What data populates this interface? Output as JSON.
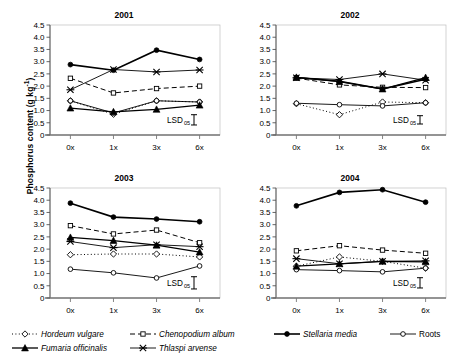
{
  "figure": {
    "ylabel_text": "Phosphorus content (g kg",
    "ylabel_sup": "-1",
    "ylabel_tail": ")",
    "lsd_label": "LSD",
    "lsd_sub": "05"
  },
  "legend": {
    "position": "bottom",
    "items": [
      {
        "name": "Hordeum vulgare",
        "marker": "open-diamond",
        "line": "dotted",
        "italic": true,
        "key": "hordeum_vulgare"
      },
      {
        "name": "Chenopodium album",
        "marker": "open-square",
        "line": "dashed",
        "italic": true,
        "key": "chenopodium_album"
      },
      {
        "name": "Stellaria media",
        "marker": "filled-circle",
        "line": "solid",
        "italic": true,
        "key": "stellaria_media"
      },
      {
        "name": "Roots",
        "marker": "open-circle",
        "line": "solid",
        "italic": false,
        "key": "roots"
      },
      {
        "name": "Fumaria officinalis",
        "marker": "filled-triangle",
        "line": "solid",
        "italic": true,
        "key": "fumaria_officinalis"
      },
      {
        "name": "Thlaspi arvense",
        "marker": "cross-x",
        "line": "solid",
        "italic": true,
        "key": "thlaspi_arvense"
      }
    ]
  },
  "chart_data": {
    "type": "line",
    "xlabel": "",
    "ylabel": "Phosphorus content (g kg-1)",
    "categories": [
      "0x",
      "1x",
      "3x",
      "6x"
    ],
    "yticks": [
      "0",
      "0.5",
      "1.0",
      "1.5",
      "2.0",
      "2.5",
      "3.0",
      "3.5",
      "4.0",
      "4.5"
    ],
    "ylim": [
      0,
      4.5
    ],
    "grid": false,
    "panels": [
      {
        "title": "2001",
        "lsd_bar": 0.42,
        "series": [
          {
            "name": "Hordeum vulgare",
            "key": "hordeum_vulgare",
            "values": [
              1.4,
              0.85,
              1.4,
              1.35
            ]
          },
          {
            "name": "Chenopodium album",
            "key": "chenopodium_album",
            "values": [
              2.32,
              1.72,
              1.9,
              2.0
            ]
          },
          {
            "name": "Stellaria media",
            "key": "stellaria_media",
            "values": [
              2.88,
              2.65,
              3.47,
              3.09
            ]
          },
          {
            "name": "Roots",
            "key": "roots",
            "values": [
              1.4,
              0.9,
              1.4,
              1.35
            ]
          },
          {
            "name": "Fumaria officinalis",
            "key": "fumaria_officinalis",
            "values": [
              1.1,
              0.95,
              1.05,
              1.22
            ]
          },
          {
            "name": "Thlaspi arvense",
            "key": "thlaspi_arvense",
            "values": [
              1.85,
              2.68,
              2.58,
              2.66
            ]
          }
        ]
      },
      {
        "title": "2002",
        "lsd_bar": 0.34,
        "series": [
          {
            "name": "Hordeum vulgare",
            "key": "hordeum_vulgare",
            "values": [
              1.28,
              0.83,
              1.35,
              1.32
            ]
          },
          {
            "name": "Chenopodium album",
            "key": "chenopodium_album",
            "values": [
              2.33,
              2.05,
              1.95,
              1.94
            ]
          },
          {
            "name": "Stellaria media",
            "key": "stellaria_media",
            "values": [
              2.35,
              2.2,
              1.88,
              2.28
            ]
          },
          {
            "name": "Roots",
            "key": "roots",
            "values": [
              1.3,
              1.24,
              1.19,
              1.32
            ]
          },
          {
            "name": "Fumaria officinalis",
            "key": "fumaria_officinalis",
            "values": [
              2.36,
              2.18,
              1.88,
              2.35
            ]
          },
          {
            "name": "Thlaspi arvense",
            "key": "thlaspi_arvense",
            "values": [
              2.34,
              2.27,
              2.5,
              2.24
            ]
          }
        ]
      },
      {
        "title": "2003",
        "lsd_bar": 0.5,
        "series": [
          {
            "name": "Hordeum vulgare",
            "key": "hordeum_vulgare",
            "values": [
              1.77,
              1.8,
              1.8,
              1.68
            ]
          },
          {
            "name": "Chenopodium album",
            "key": "chenopodium_album",
            "values": [
              2.96,
              2.62,
              2.78,
              2.26
            ]
          },
          {
            "name": "Stellaria media",
            "key": "stellaria_media",
            "values": [
              3.88,
              3.31,
              3.23,
              3.12
            ]
          },
          {
            "name": "Roots",
            "key": "roots",
            "values": [
              1.18,
              1.03,
              0.82,
              1.31
            ]
          },
          {
            "name": "Fumaria officinalis",
            "key": "fumaria_officinalis",
            "values": [
              2.48,
              2.35,
              2.16,
              1.88
            ]
          },
          {
            "name": "Thlaspi arvense",
            "key": "thlaspi_arvense",
            "values": [
              2.31,
              2.06,
              2.18,
              2.1
            ]
          }
        ]
      },
      {
        "title": "2004",
        "lsd_bar": 0.42,
        "series": [
          {
            "name": "Hordeum vulgare",
            "key": "hordeum_vulgare",
            "values": [
              1.3,
              1.68,
              1.5,
              1.22
            ]
          },
          {
            "name": "Chenopodium album",
            "key": "chenopodium_album",
            "values": [
              1.93,
              2.14,
              1.96,
              1.83
            ]
          },
          {
            "name": "Stellaria media",
            "key": "stellaria_media",
            "values": [
              3.77,
              4.32,
              4.43,
              3.92
            ]
          },
          {
            "name": "Roots",
            "key": "roots",
            "values": [
              1.16,
              1.12,
              1.07,
              1.22
            ]
          },
          {
            "name": "Fumaria officinalis",
            "key": "fumaria_officinalis",
            "values": [
              1.3,
              1.4,
              1.5,
              1.48
            ]
          },
          {
            "name": "Thlaspi arvense",
            "key": "thlaspi_arvense",
            "values": [
              1.61,
              1.4,
              1.5,
              1.52
            ]
          }
        ]
      }
    ]
  }
}
